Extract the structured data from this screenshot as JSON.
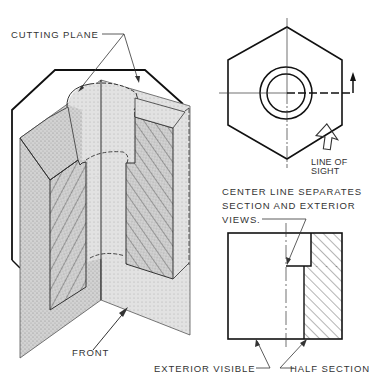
{
  "figure": {
    "labels": {
      "cutting_plane": "CUTTING PLANE",
      "line_of_sight_1": "LINE OF",
      "line_of_sight_2": "SIGHT",
      "center_line_note_1": "CENTER LINE SEPARATES",
      "center_line_note_2": "SECTION AND EXTERIOR",
      "center_line_note_3": "VIEWS.",
      "front": "FRONT",
      "exterior_visible": "EXTERIOR VISIBLE",
      "half_section": "HALF SECTION"
    },
    "views": [
      {
        "name": "pictorial-cutaway",
        "description": "Isometric hexagonal block with quarter removed by two perpendicular cutting planes"
      },
      {
        "name": "top-view",
        "description": "Hexagon with counterbore circles, cutting plane line and line-of-sight arrow"
      },
      {
        "name": "front-view",
        "description": "Half section: left exterior, right sectioned with hatching"
      }
    ],
    "colors": {
      "line": "#1a1a1a",
      "stipple": "#c9c9c9",
      "hatch": "#3a3a3a",
      "text": "#333333"
    }
  }
}
